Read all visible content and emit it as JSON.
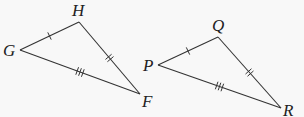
{
  "figure": {
    "triangles": [
      {
        "name": "GHF",
        "vertices": {
          "G": {
            "label": "G",
            "x": 20,
            "y": 50
          },
          "H": {
            "label": "H",
            "x": 79,
            "y": 22
          },
          "F": {
            "label": "F",
            "x": 140,
            "y": 94
          }
        },
        "sides": [
          {
            "from": "G",
            "to": "H",
            "ticks": 1
          },
          {
            "from": "H",
            "to": "F",
            "ticks": 2
          },
          {
            "from": "G",
            "to": "F",
            "ticks": 3
          }
        ]
      },
      {
        "name": "PQR",
        "vertices": {
          "P": {
            "label": "P",
            "x": 158,
            "y": 65
          },
          "Q": {
            "label": "Q",
            "x": 218,
            "y": 37
          },
          "R": {
            "label": "R",
            "x": 281,
            "y": 108
          }
        },
        "sides": [
          {
            "from": "P",
            "to": "Q",
            "ticks": 1
          },
          {
            "from": "Q",
            "to": "R",
            "ticks": 2
          },
          {
            "from": "P",
            "to": "R",
            "ticks": 3
          }
        ]
      }
    ],
    "colors": {
      "line": "#333333",
      "background": "#f8f8f8"
    }
  }
}
